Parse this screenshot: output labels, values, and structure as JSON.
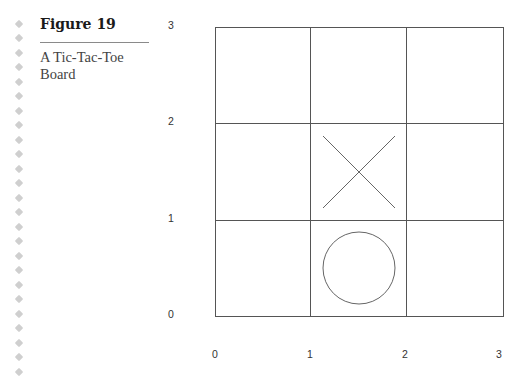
{
  "figure": {
    "title": "Figure 19",
    "caption": "A Tic-Tac-Toe Board"
  },
  "board": {
    "rows": 3,
    "cols": 3,
    "line_color": "#555555",
    "marks": [
      {
        "type": "X",
        "icon": "x-mark-icon",
        "cell": {
          "col": 1,
          "row": 1
        },
        "label": "X"
      },
      {
        "type": "O",
        "icon": "o-mark-icon",
        "cell": {
          "col": 1,
          "row": 0
        },
        "label": "O"
      }
    ]
  },
  "axes": {
    "x_ticks": [
      "0",
      "1",
      "2",
      "3"
    ],
    "y_ticks": [
      "3",
      "2",
      "1",
      "0"
    ]
  },
  "margin": {
    "decoration_icon": "diamond-dot-icon",
    "dot_color": "#cfcfcf"
  }
}
